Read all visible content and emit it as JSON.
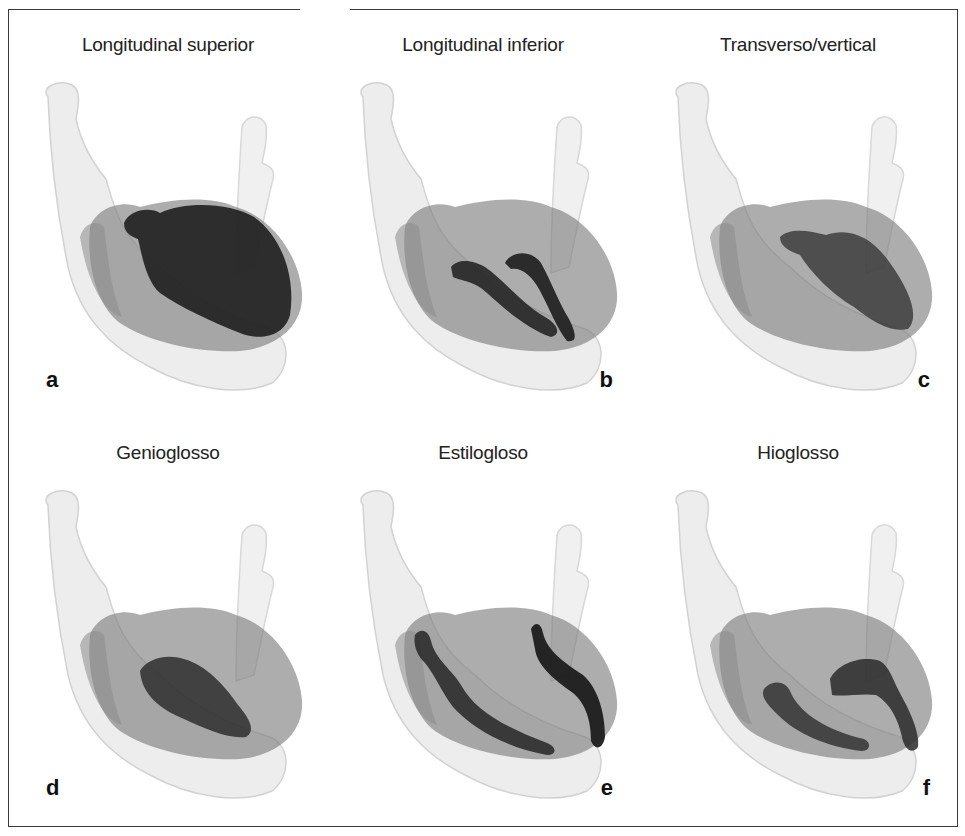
{
  "figure": {
    "panels": [
      {
        "id": "a",
        "letter": "a",
        "title": "Longitudinal superior",
        "muscle": "longitudinal-superior"
      },
      {
        "id": "b",
        "letter": "b",
        "title": "Longitudinal inferior",
        "muscle": "longitudinal-inferior"
      },
      {
        "id": "c",
        "letter": "c",
        "title": "Transverso/vertical",
        "muscle": "transverso-vertical"
      },
      {
        "id": "d",
        "letter": "d",
        "title": "Genioglosso",
        "muscle": "genioglosso"
      },
      {
        "id": "e",
        "letter": "e",
        "title": "Estilogloso",
        "muscle": "estilogloso"
      },
      {
        "id": "f",
        "letter": "f",
        "title": "Hioglosso",
        "muscle": "hioglosso"
      }
    ],
    "colors": {
      "mandible": "#ececec",
      "mandible_edge": "#cfcfcf",
      "tongue": "#8f8f8f",
      "muscle_dark": "#2a2a2a",
      "border": "#3a3a3a"
    }
  }
}
